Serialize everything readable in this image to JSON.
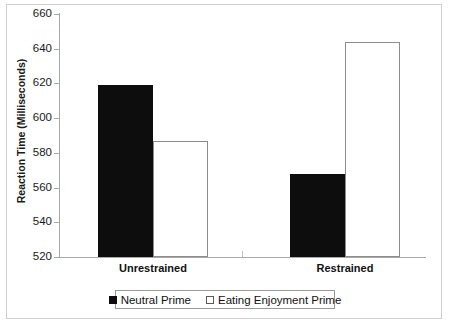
{
  "chart_data": {
    "type": "bar",
    "title": "",
    "xlabel": "",
    "ylabel": "Reaction Time (Milliseconds)",
    "categories": [
      "Unrestrained",
      "Restrained"
    ],
    "series": [
      {
        "name": "Neutral Prime",
        "color": "#0d0d0d",
        "values": [
          619,
          568
        ]
      },
      {
        "name": "Eating Enjoyment Prime",
        "color": "#ffffff",
        "values": [
          587,
          644
        ]
      }
    ],
    "ylim": [
      520,
      660
    ],
    "ytick_values": [
      520,
      540,
      560,
      580,
      600,
      620,
      640,
      660
    ],
    "ytick_labels": [
      "520",
      "540",
      "560",
      "580",
      "600",
      "620",
      "640",
      "660"
    ],
    "grid": false,
    "legend_position": "bottom"
  },
  "axis": {
    "y_title": "Reaction Time (Milliseconds)"
  },
  "legend": {
    "entries": [
      {
        "label": "Neutral Prime",
        "swatch": "filled-black-square-icon"
      },
      {
        "label": "Eating Enjoyment Prime",
        "swatch": "empty-white-square-icon"
      }
    ]
  }
}
